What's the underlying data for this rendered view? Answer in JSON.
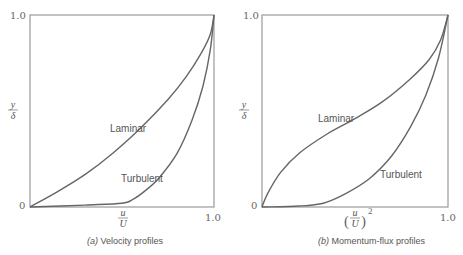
{
  "chart_data": [
    {
      "type": "line",
      "title": "(a) Velocity profiles",
      "caption_prefix": "(a)",
      "caption_text": "Velocity profiles",
      "xlabel_num": "u",
      "xlabel_den": "U",
      "ylabel_num": "y",
      "ylabel_den": "δ",
      "xlim": [
        0,
        1.0
      ],
      "ylim": [
        0,
        1.0
      ],
      "x_ticks": [
        "1.0"
      ],
      "y_ticks": [
        "0",
        "1.0"
      ],
      "grid": false,
      "legend": "inline labels",
      "series": [
        {
          "name": "Laminar",
          "x": [
            0,
            0.15,
            0.3,
            0.45,
            0.6,
            0.75,
            0.85,
            0.93,
            0.98,
            1.0
          ],
          "y": [
            0,
            0.08,
            0.17,
            0.28,
            0.41,
            0.56,
            0.68,
            0.8,
            0.9,
            1.0
          ]
        },
        {
          "name": "Turbulent",
          "x": [
            0,
            0.3,
            0.5,
            0.56,
            0.62,
            0.7,
            0.8,
            0.88,
            0.94,
            0.98,
            1.0
          ],
          "y": [
            0,
            0.01,
            0.02,
            0.04,
            0.08,
            0.15,
            0.28,
            0.45,
            0.63,
            0.82,
            1.0
          ]
        }
      ],
      "annotations": [
        {
          "text": "Laminar",
          "x": 0.42,
          "y": 0.38
        },
        {
          "text": "Turbulent",
          "x": 0.49,
          "y": 0.13
        }
      ]
    },
    {
      "type": "line",
      "title": "(b) Momentum-flux profiles",
      "caption_prefix": "(b)",
      "caption_text": "Momentum-flux profiles",
      "xlabel_num": "u",
      "xlabel_den": "U",
      "xlabel_power": "2",
      "ylabel_num": "y",
      "ylabel_den": "δ",
      "xlim": [
        0,
        1.0
      ],
      "ylim": [
        0,
        1.0
      ],
      "x_ticks": [
        "1.0"
      ],
      "y_ticks": [
        "0",
        "1.0"
      ],
      "grid": false,
      "legend": "inline labels",
      "series": [
        {
          "name": "Laminar",
          "x": [
            0,
            0.03,
            0.1,
            0.2,
            0.35,
            0.5,
            0.65,
            0.8,
            0.9,
            0.96,
            1.0
          ],
          "y": [
            0,
            0.07,
            0.18,
            0.28,
            0.38,
            0.46,
            0.55,
            0.67,
            0.77,
            0.87,
            1.0
          ]
        },
        {
          "name": "Turbulent",
          "x": [
            0,
            0.2,
            0.33,
            0.45,
            0.58,
            0.7,
            0.8,
            0.88,
            0.95,
            1.0
          ],
          "y": [
            0,
            0.005,
            0.02,
            0.07,
            0.15,
            0.27,
            0.42,
            0.58,
            0.78,
            1.0
          ]
        }
      ],
      "annotations": [
        {
          "text": "Laminar",
          "x": 0.3,
          "y": 0.46
        },
        {
          "text": "Turbulent",
          "x": 0.63,
          "y": 0.15
        }
      ]
    }
  ],
  "panels": {
    "a": {
      "y_top": "1.0",
      "y_zero": "0",
      "x_end": "1.0",
      "ylabel_num": "y",
      "ylabel_den": "δ",
      "xlabel_num": "u",
      "xlabel_den": "U",
      "label_laminar": "Laminar",
      "label_turbulent": "Turbulent",
      "caption_prefix": "(a)",
      "caption_text": "Velocity profiles"
    },
    "b": {
      "y_top": "1.0",
      "y_zero": "0",
      "x_end": "1.0",
      "ylabel_num": "y",
      "ylabel_den": "δ",
      "xlabel_num": "u",
      "xlabel_den": "U",
      "xlabel_power": "2",
      "label_laminar": "Laminar",
      "label_turbulent": "Turbulent",
      "caption_prefix": "(b)",
      "caption_text": "Momentum-flux profiles"
    }
  }
}
